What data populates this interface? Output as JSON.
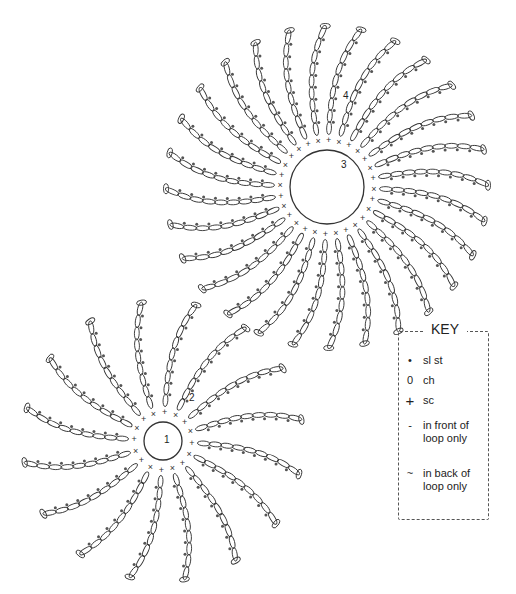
{
  "key": {
    "title": "KEY",
    "items": [
      {
        "symbol": "sl-st-dot",
        "glyph": "•",
        "label": "sl st"
      },
      {
        "symbol": "ch-oval",
        "glyph": "0",
        "label": "ch"
      },
      {
        "symbol": "sc-plus",
        "glyph": "+",
        "label": "sc"
      },
      {
        "symbol": "front-loop-dash",
        "glyph": "-",
        "label": "in front of\nloop only"
      },
      {
        "symbol": "back-loop-tilde",
        "glyph": "~",
        "label": "in back of\nloop only"
      }
    ]
  },
  "motifs": [
    {
      "name": "large-motif",
      "cx": 327,
      "cy": 187,
      "ring_r": 37,
      "sc_r": 47,
      "spoke_len": 108,
      "spokes": 28,
      "round_labels": [
        {
          "text": "3",
          "x": 341,
          "y": 168
        },
        {
          "text": "4",
          "x": 343,
          "y": 99
        }
      ]
    },
    {
      "name": "small-motif",
      "cx": 163,
      "cy": 441,
      "ring_r": 19,
      "sc_r": 29,
      "spoke_len": 105,
      "spokes": 16,
      "round_labels": [
        {
          "text": "1",
          "x": 164,
          "y": 443
        },
        {
          "text": "2",
          "x": 189,
          "y": 401
        }
      ]
    }
  ],
  "colors": {
    "line": "#333333",
    "dot": "#555555"
  }
}
